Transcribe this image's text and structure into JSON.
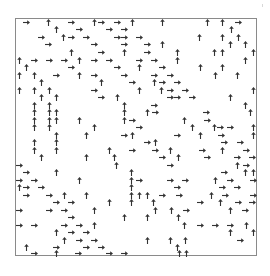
{
  "figure": {
    "type": "arrow-field",
    "frame": {
      "x": 15,
      "y": 18,
      "width": 242,
      "height": 238,
      "border_color": "#8a8a8a"
    },
    "arrow_color": "#333333",
    "directions": {
      "up": "up-arrow-icon",
      "right": "right-arrow-icon"
    },
    "arrows": [
      [
        26,
        22,
        "right"
      ],
      [
        48,
        22,
        "up"
      ],
      [
        71,
        22,
        "right"
      ],
      [
        94,
        22,
        "up"
      ],
      [
        101,
        22,
        "right"
      ],
      [
        117,
        22,
        "right"
      ],
      [
        132,
        22,
        "up"
      ],
      [
        162,
        22,
        "up"
      ],
      [
        207,
        22,
        "up"
      ],
      [
        222,
        22,
        "up"
      ],
      [
        238,
        22,
        "right"
      ],
      [
        56,
        29,
        "up"
      ],
      [
        79,
        29,
        "right"
      ],
      [
        109,
        29,
        "right"
      ],
      [
        124,
        29,
        "right"
      ],
      [
        231,
        29,
        "up"
      ],
      [
        41,
        37,
        "right"
      ],
      [
        63,
        37,
        "up"
      ],
      [
        71,
        37,
        "right"
      ],
      [
        86,
        37,
        "right"
      ],
      [
        117,
        37,
        "right"
      ],
      [
        124,
        37,
        "right"
      ],
      [
        139,
        37,
        "right"
      ],
      [
        199,
        37,
        "up"
      ],
      [
        222,
        37,
        "up"
      ],
      [
        238,
        37,
        "up"
      ],
      [
        48,
        44,
        "right"
      ],
      [
        94,
        44,
        "right"
      ],
      [
        124,
        44,
        "right"
      ],
      [
        147,
        44,
        "right"
      ],
      [
        162,
        44,
        "up"
      ],
      [
        230,
        44,
        "up"
      ],
      [
        245,
        44,
        "up"
      ],
      [
        71,
        52,
        "up"
      ],
      [
        101,
        52,
        "right"
      ],
      [
        124,
        52,
        "up"
      ],
      [
        147,
        52,
        "right"
      ],
      [
        177,
        52,
        "up"
      ],
      [
        214,
        52,
        "up"
      ],
      [
        222,
        52,
        "up"
      ],
      [
        253,
        52,
        "up"
      ],
      [
        19,
        60,
        "up"
      ],
      [
        34,
        60,
        "right"
      ],
      [
        49,
        60,
        "right"
      ],
      [
        64,
        60,
        "right"
      ],
      [
        79,
        60,
        "up"
      ],
      [
        94,
        60,
        "right"
      ],
      [
        109,
        60,
        "right"
      ],
      [
        139,
        60,
        "right"
      ],
      [
        154,
        60,
        "right"
      ],
      [
        177,
        60,
        "up"
      ],
      [
        245,
        60,
        "up"
      ],
      [
        26,
        67,
        "up"
      ],
      [
        71,
        67,
        "right"
      ],
      [
        117,
        67,
        "right"
      ],
      [
        139,
        67,
        "up"
      ],
      [
        162,
        67,
        "right"
      ],
      [
        200,
        67,
        "up"
      ],
      [
        222,
        67,
        "up"
      ],
      [
        19,
        75,
        "up"
      ],
      [
        34,
        75,
        "up"
      ],
      [
        56,
        75,
        "right"
      ],
      [
        79,
        75,
        "up"
      ],
      [
        94,
        75,
        "right"
      ],
      [
        124,
        75,
        "right"
      ],
      [
        154,
        75,
        "right"
      ],
      [
        170,
        75,
        "right"
      ],
      [
        215,
        75,
        "up"
      ],
      [
        237,
        75,
        "up"
      ],
      [
        41,
        82,
        "up"
      ],
      [
        101,
        82,
        "up"
      ],
      [
        132,
        82,
        "right"
      ],
      [
        154,
        82,
        "up"
      ],
      [
        162,
        82,
        "right"
      ],
      [
        177,
        82,
        "right"
      ],
      [
        19,
        90,
        "up"
      ],
      [
        34,
        90,
        "up"
      ],
      [
        49,
        90,
        "up"
      ],
      [
        94,
        90,
        "right"
      ],
      [
        139,
        90,
        "up"
      ],
      [
        161,
        90,
        "up"
      ],
      [
        170,
        90,
        "right"
      ],
      [
        185,
        90,
        "right"
      ],
      [
        253,
        90,
        "up"
      ],
      [
        41,
        97,
        "up"
      ],
      [
        56,
        97,
        "up"
      ],
      [
        101,
        97,
        "right"
      ],
      [
        117,
        97,
        "up"
      ],
      [
        170,
        97,
        "right"
      ],
      [
        177,
        97,
        "right"
      ],
      [
        192,
        97,
        "right"
      ],
      [
        230,
        97,
        "up"
      ],
      [
        34,
        105,
        "up"
      ],
      [
        49,
        105,
        "up"
      ],
      [
        124,
        105,
        "up"
      ],
      [
        154,
        105,
        "right"
      ],
      [
        245,
        105,
        "up"
      ],
      [
        34,
        112,
        "up"
      ],
      [
        49,
        112,
        "up"
      ],
      [
        56,
        112,
        "up"
      ],
      [
        124,
        112,
        "up"
      ],
      [
        147,
        112,
        "up"
      ],
      [
        155,
        112,
        "right"
      ],
      [
        206,
        112,
        "right"
      ],
      [
        250,
        112,
        "up"
      ],
      [
        34,
        120,
        "up"
      ],
      [
        49,
        120,
        "up"
      ],
      [
        56,
        120,
        "up"
      ],
      [
        79,
        120,
        "up"
      ],
      [
        124,
        120,
        "up"
      ],
      [
        132,
        120,
        "right"
      ],
      [
        184,
        120,
        "up"
      ],
      [
        207,
        120,
        "right"
      ],
      [
        34,
        127,
        "up"
      ],
      [
        49,
        127,
        "up"
      ],
      [
        94,
        127,
        "up"
      ],
      [
        139,
        127,
        "right"
      ],
      [
        192,
        127,
        "up"
      ],
      [
        214,
        127,
        "up"
      ],
      [
        220,
        127,
        "right"
      ],
      [
        230,
        127,
        "right"
      ],
      [
        253,
        127,
        "up"
      ],
      [
        56,
        135,
        "up"
      ],
      [
        86,
        135,
        "up"
      ],
      [
        124,
        135,
        "right"
      ],
      [
        132,
        135,
        "up"
      ],
      [
        177,
        135,
        "right"
      ],
      [
        200,
        135,
        "up"
      ],
      [
        221,
        135,
        "right"
      ],
      [
        253,
        135,
        "up"
      ],
      [
        34,
        142,
        "up"
      ],
      [
        56,
        142,
        "up"
      ],
      [
        147,
        142,
        "right"
      ],
      [
        155,
        142,
        "up"
      ],
      [
        224,
        142,
        "right"
      ],
      [
        240,
        142,
        "right"
      ],
      [
        34,
        150,
        "up"
      ],
      [
        56,
        150,
        "up"
      ],
      [
        109,
        150,
        "up"
      ],
      [
        132,
        150,
        "right"
      ],
      [
        155,
        150,
        "right"
      ],
      [
        170,
        150,
        "up"
      ],
      [
        202,
        150,
        "right"
      ],
      [
        222,
        150,
        "up"
      ],
      [
        246,
        150,
        "right"
      ],
      [
        41,
        157,
        "up"
      ],
      [
        86,
        157,
        "up"
      ],
      [
        114,
        157,
        "up"
      ],
      [
        162,
        157,
        "right"
      ],
      [
        178,
        157,
        "up"
      ],
      [
        207,
        157,
        "right"
      ],
      [
        237,
        157,
        "right"
      ],
      [
        252,
        157,
        "right"
      ],
      [
        19,
        165,
        "right"
      ],
      [
        116,
        165,
        "up"
      ],
      [
        170,
        165,
        "right"
      ],
      [
        237,
        165,
        "up"
      ],
      [
        246,
        165,
        "right"
      ],
      [
        26,
        172,
        "right"
      ],
      [
        56,
        172,
        "up"
      ],
      [
        131,
        172,
        "up"
      ],
      [
        224,
        172,
        "right"
      ],
      [
        245,
        172,
        "up"
      ],
      [
        253,
        172,
        "up"
      ],
      [
        19,
        180,
        "right"
      ],
      [
        34,
        180,
        "right"
      ],
      [
        79,
        180,
        "up"
      ],
      [
        131,
        180,
        "up"
      ],
      [
        139,
        180,
        "right"
      ],
      [
        170,
        180,
        "right"
      ],
      [
        185,
        180,
        "right"
      ],
      [
        215,
        180,
        "up"
      ],
      [
        230,
        180,
        "right"
      ],
      [
        253,
        180,
        "right"
      ],
      [
        19,
        187,
        "up"
      ],
      [
        26,
        187,
        "right"
      ],
      [
        41,
        187,
        "right"
      ],
      [
        131,
        187,
        "up"
      ],
      [
        177,
        187,
        "right"
      ],
      [
        222,
        187,
        "right"
      ],
      [
        237,
        187,
        "right"
      ],
      [
        26,
        195,
        "right"
      ],
      [
        49,
        195,
        "right"
      ],
      [
        64,
        195,
        "up"
      ],
      [
        86,
        195,
        "up"
      ],
      [
        131,
        195,
        "up"
      ],
      [
        139,
        195,
        "up"
      ],
      [
        147,
        195,
        "up"
      ],
      [
        162,
        195,
        "right"
      ],
      [
        179,
        195,
        "right"
      ],
      [
        211,
        195,
        "up"
      ],
      [
        225,
        195,
        "right"
      ],
      [
        253,
        195,
        "right"
      ],
      [
        56,
        202,
        "right"
      ],
      [
        71,
        202,
        "right"
      ],
      [
        109,
        202,
        "up"
      ],
      [
        131,
        202,
        "up"
      ],
      [
        153,
        202,
        "up"
      ],
      [
        200,
        202,
        "right"
      ],
      [
        220,
        202,
        "up"
      ],
      [
        238,
        202,
        "right"
      ],
      [
        252,
        202,
        "right"
      ],
      [
        19,
        210,
        "right"
      ],
      [
        49,
        210,
        "right"
      ],
      [
        64,
        210,
        "right"
      ],
      [
        94,
        210,
        "up"
      ],
      [
        155,
        210,
        "up"
      ],
      [
        171,
        210,
        "up"
      ],
      [
        186,
        210,
        "right"
      ],
      [
        230,
        210,
        "up"
      ],
      [
        245,
        210,
        "right"
      ],
      [
        71,
        217,
        "right"
      ],
      [
        124,
        217,
        "up"
      ],
      [
        147,
        217,
        "up"
      ],
      [
        178,
        217,
        "up"
      ],
      [
        19,
        225,
        "right"
      ],
      [
        34,
        225,
        "right"
      ],
      [
        64,
        225,
        "right"
      ],
      [
        79,
        225,
        "right"
      ],
      [
        94,
        225,
        "up"
      ],
      [
        184,
        225,
        "up"
      ],
      [
        200,
        225,
        "right"
      ],
      [
        215,
        225,
        "right"
      ],
      [
        230,
        225,
        "right"
      ],
      [
        246,
        225,
        "up"
      ],
      [
        56,
        232,
        "up"
      ],
      [
        71,
        232,
        "right"
      ],
      [
        86,
        232,
        "right"
      ],
      [
        230,
        232,
        "up"
      ],
      [
        253,
        232,
        "up"
      ],
      [
        64,
        240,
        "up"
      ],
      [
        79,
        240,
        "right"
      ],
      [
        94,
        240,
        "right"
      ],
      [
        147,
        240,
        "up"
      ],
      [
        170,
        240,
        "up"
      ],
      [
        185,
        240,
        "up"
      ],
      [
        240,
        240,
        "right"
      ],
      [
        26,
        247,
        "up"
      ],
      [
        56,
        247,
        "right"
      ],
      [
        86,
        247,
        "right"
      ],
      [
        101,
        247,
        "right"
      ],
      [
        177,
        247,
        "up"
      ],
      [
        34,
        253,
        "right"
      ],
      [
        56,
        253,
        "up"
      ],
      [
        78,
        253,
        "right"
      ],
      [
        109,
        253,
        "right"
      ],
      [
        124,
        253,
        "right"
      ],
      [
        179,
        253,
        "up"
      ],
      [
        186,
        253,
        "up"
      ]
    ]
  }
}
